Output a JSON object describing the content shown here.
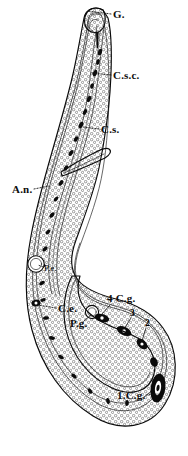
{
  "figure": {
    "background_color": "#ffffff",
    "ink_color": "#0b0b0b",
    "style": "engraving-line-drawing",
    "orientation": "head-at-top, body-curving-into-hook"
  },
  "labels": [
    {
      "id": "g",
      "text": "G.",
      "meaning": "gland",
      "x": 113,
      "y": 18,
      "leader": {
        "from_x": 111,
        "from_y": 14,
        "to_x": 88,
        "to_y": 11,
        "style": "dotted"
      }
    },
    {
      "id": "csc",
      "text": "C.s.c.",
      "meaning": "sub-cuticular cell",
      "x": 113,
      "y": 79,
      "leader": {
        "from_x": 111,
        "from_y": 75,
        "to_x": 92,
        "to_y": 73,
        "style": "dotted"
      }
    },
    {
      "id": "cs",
      "text": "C.s.",
      "meaning": "sub-cuticular layer",
      "x": 101,
      "y": 133,
      "leader": {
        "from_x": 99,
        "from_y": 129,
        "to_x": 83,
        "to_y": 127,
        "style": "dotted"
      }
    },
    {
      "id": "an",
      "text": "A.n.",
      "meaning": "nerve ring / anterior nerve",
      "x": 12,
      "y": 193,
      "leader": {
        "from_x": 34,
        "from_y": 189,
        "to_x": 48,
        "to_y": 186,
        "style": "dotted"
      }
    },
    {
      "id": "pe",
      "text": "P.e.",
      "meaning": "excretory pore",
      "x": 44,
      "y": 271,
      "leader": {
        "from_x": 43,
        "from_y": 267,
        "to_x": 37,
        "to_y": 265,
        "style": "dotted"
      }
    },
    {
      "id": "ce",
      "text": "C.e.",
      "meaning": "excretory cell",
      "x": 58,
      "y": 312,
      "leader": {
        "from_x": 56,
        "from_y": 308,
        "to_x": 36,
        "to_y": 305,
        "style": "dotted"
      }
    },
    {
      "id": "pg",
      "text": "P.g.",
      "meaning": "pore of gland",
      "x": 70,
      "y": 327,
      "leader": {
        "from_x": 84,
        "from_y": 321,
        "to_x": 92,
        "to_y": 314,
        "style": "solid"
      }
    },
    {
      "id": "cg4",
      "text": "4 C.g.",
      "meaning": "fourth caudal gland",
      "x": 108,
      "y": 302,
      "leader": {
        "from_x": 110,
        "from_y": 305,
        "to_x": 101,
        "to_y": 316,
        "style": "solid"
      }
    },
    {
      "id": "cg3",
      "text": "3",
      "meaning": "third caudal gland",
      "x": 131,
      "y": 315,
      "leader": {
        "from_x": 131,
        "from_y": 318,
        "to_x": 124,
        "to_y": 330,
        "style": "solid"
      }
    },
    {
      "id": "cg2",
      "text": "2",
      "meaning": "second caudal gland",
      "x": 146,
      "y": 325,
      "leader": {
        "from_x": 146,
        "from_y": 328,
        "to_x": 141,
        "to_y": 340,
        "style": "solid"
      }
    },
    {
      "id": "cg1",
      "text": "1.C.g.",
      "meaning": "first caudal gland",
      "x": 117,
      "y": 399,
      "leader": {
        "from_x": 146,
        "from_y": 395,
        "to_x": 157,
        "to_y": 394,
        "style": "dotted"
      }
    }
  ],
  "features": [
    {
      "id": "head-cap",
      "name": "anterior-head-cap",
      "interactable": false
    },
    {
      "id": "buccal-stylet",
      "name": "buccal-stylet",
      "interactable": false
    },
    {
      "id": "cuticle",
      "name": "cuticle-outer-wall",
      "interactable": false
    },
    {
      "id": "oesophagus",
      "name": "oesophagus-lumen",
      "interactable": false
    },
    {
      "id": "spicule",
      "name": "lateral-appendage",
      "interactable": false
    },
    {
      "id": "excretory-pore",
      "name": "excretory-pore-vacuole",
      "interactable": false
    },
    {
      "id": "gland-vacuole",
      "name": "gland-pore-vacuole",
      "interactable": false
    },
    {
      "id": "caudal-glands",
      "name": "caudal-gland-chain",
      "interactable": false
    },
    {
      "id": "tail-loop",
      "name": "posterior-tail-loop",
      "interactable": false
    },
    {
      "id": "granular-tissue",
      "name": "granular-cell-tissue",
      "interactable": false
    }
  ]
}
